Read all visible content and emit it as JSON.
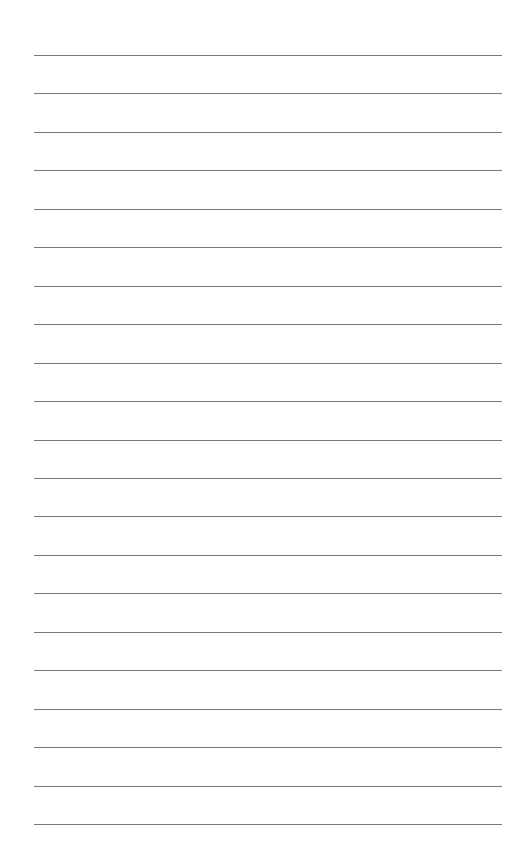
{
  "page": {
    "type": "lined-paper",
    "line_count": 21,
    "line_color": "#7a7a7a",
    "background_color": "#ffffff",
    "first_line_y": 55,
    "line_spacing": 38.45,
    "line_left": 34,
    "line_right": 502
  }
}
